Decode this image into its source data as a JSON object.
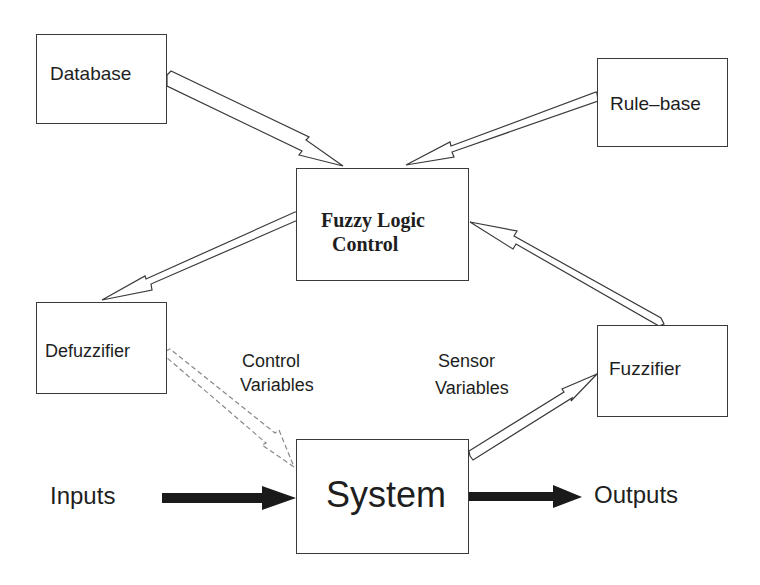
{
  "diagram": {
    "type": "block-diagram",
    "nodes": {
      "database": {
        "label": "Database"
      },
      "rule_base": {
        "label": "Rule–base"
      },
      "flc": {
        "label_line1": "Fuzzy Logic",
        "label_line2": "Control"
      },
      "defuzzifier": {
        "label": "Defuzzifier"
      },
      "fuzzifier": {
        "label": "Fuzzifier"
      },
      "system": {
        "label": "System"
      }
    },
    "labels": {
      "control_line1": "Control",
      "control_line2": "Variables",
      "sensor_line1": "Sensor",
      "sensor_line2": "Variables",
      "inputs": "Inputs",
      "outputs": "Outputs"
    },
    "edges": [
      {
        "from": "Database",
        "to": "Fuzzy Logic Control",
        "style": "hollow"
      },
      {
        "from": "Rule-base",
        "to": "Fuzzy Logic Control",
        "style": "hollow"
      },
      {
        "from": "Fuzzy Logic Control",
        "to": "Defuzzifier",
        "style": "hollow"
      },
      {
        "from": "Fuzzifier",
        "to": "Fuzzy Logic Control",
        "style": "hollow"
      },
      {
        "from": "Defuzzifier",
        "to": "System",
        "style": "hollow",
        "label": "Control Variables"
      },
      {
        "from": "System",
        "to": "Fuzzifier",
        "style": "hollow",
        "label": "Sensor Variables"
      },
      {
        "from": "Inputs",
        "to": "System",
        "style": "solid"
      },
      {
        "from": "System",
        "to": "Outputs",
        "style": "solid"
      }
    ],
    "colors": {
      "line": "#3a3a3a",
      "fill_solid": "#1a1a1a",
      "background": "#ffffff"
    }
  }
}
